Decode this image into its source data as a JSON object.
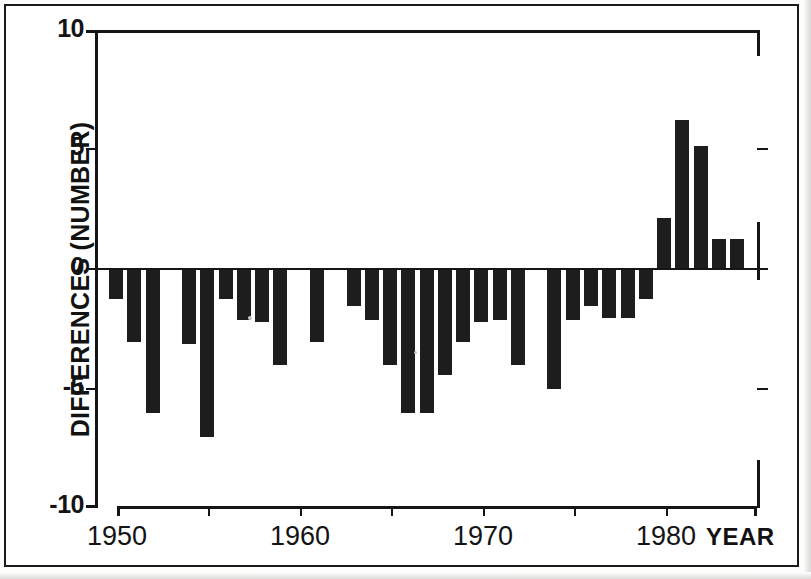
{
  "chart_data": {
    "type": "bar",
    "title": "",
    "xlabel": "YEAR",
    "ylabel": "DIFFERENCES (NUMBER)",
    "xlim": [
      1949,
      1985
    ],
    "ylim": [
      -10,
      10
    ],
    "grid": false,
    "legend": null,
    "y_ticks": [
      10,
      5,
      0,
      -5,
      -10
    ],
    "y_tick_labels": [
      "10",
      "5",
      "0",
      "-5",
      "-10"
    ],
    "x_ticks": [
      1950,
      1955,
      1960,
      1965,
      1970,
      1975,
      1980
    ],
    "x_tick_labels": [
      "1950",
      "",
      "1960",
      "",
      "1970",
      "",
      "1980"
    ],
    "categories": [
      1950,
      1951,
      1952,
      1953,
      1954,
      1955,
      1956,
      1957,
      1958,
      1959,
      1960,
      1961,
      1962,
      1963,
      1964,
      1965,
      1966,
      1967,
      1968,
      1969,
      1970,
      1971,
      1972,
      1973,
      1974,
      1975,
      1976,
      1977,
      1978,
      1979,
      1980,
      1981,
      1982,
      1983,
      1984
    ],
    "values": [
      -1.2,
      -3.0,
      -6.0,
      0.0,
      -3.1,
      -7.0,
      -1.2,
      -2.1,
      -2.2,
      -4.0,
      0.0,
      -3.0,
      0.0,
      -1.5,
      -2.1,
      -4.0,
      -6.0,
      -6.0,
      -4.4,
      -3.0,
      -2.2,
      -2.1,
      -4.0,
      0.0,
      -5.0,
      -2.1,
      -1.5,
      -2.0,
      -2.0,
      -1.2,
      2.1,
      6.2,
      5.1,
      1.2,
      1.2
    ]
  },
  "axis": {
    "y_title": "DIFFERENCES (NUMBER)",
    "x_title": "YEAR",
    "y_labels": [
      "10",
      "5",
      "0",
      "-5",
      "-10"
    ],
    "x_labels": [
      "1950",
      "1960",
      "1970",
      "1980"
    ]
  }
}
